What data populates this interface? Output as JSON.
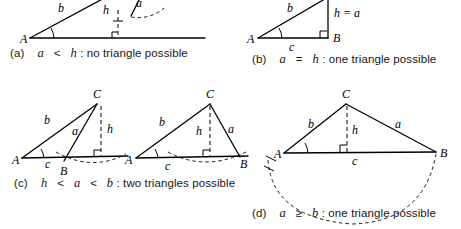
{
  "figure": {
    "panels": [
      {
        "id": "a",
        "tag": "(a)",
        "condition": "a < h",
        "result": "no triangle possible",
        "caption": "(a)  a < h: no triangle possible",
        "labels": [
          "A",
          "b",
          "h",
          "a"
        ],
        "vertices": [
          "A"
        ],
        "has_arc": true,
        "has_right_angle": true,
        "triangle_count": 0
      },
      {
        "id": "b",
        "tag": "(b)",
        "condition": "a = h",
        "result": "one triangle possible",
        "caption": "(b)  a = h: one triangle possible",
        "labels": [
          "A",
          "B",
          "b",
          "c",
          "h = a"
        ],
        "vertices": [
          "A",
          "B"
        ],
        "has_arc": false,
        "has_right_angle": true,
        "triangle_count": 1
      },
      {
        "id": "c",
        "tag": "(c)",
        "condition": "h < a < b",
        "result": "two triangles possible",
        "caption": "(c)  h < a < b: two triangles possible",
        "labels": [
          "A",
          "B",
          "C",
          "a",
          "b",
          "c",
          "h"
        ],
        "vertices": [
          "A",
          "B",
          "C"
        ],
        "has_arc": true,
        "has_right_angle": true,
        "triangle_count": 2
      },
      {
        "id": "d",
        "tag": "(d)",
        "condition": "a ≥ b",
        "result": "one triangle possible",
        "caption": "(d)  a ≥ b: one triangle possible",
        "labels": [
          "A",
          "B",
          "C",
          "a",
          "b",
          "c",
          "h"
        ],
        "vertices": [
          "A",
          "B",
          "C"
        ],
        "has_arc": true,
        "has_right_angle": true,
        "triangle_count": 1
      }
    ],
    "captions": {
      "a": {
        "tag": "(a)",
        "cond_left": "a",
        "op": "<",
        "cond_right": "h",
        "text": ": no triangle possible"
      },
      "b": {
        "tag": "(b)",
        "cond_left": "a",
        "op": "=",
        "cond_right": "h",
        "text": ": one triangle possible"
      },
      "c": {
        "tag": "(c)",
        "cond_left": "h",
        "op": "<",
        "cond_mid": "a",
        "op2": "<",
        "cond_right": "b",
        "text": ": two triangles possible"
      },
      "d": {
        "tag": "(d)",
        "cond_left": "a",
        "op": "≥",
        "cond_right": "b",
        "text": ": one triangle possible"
      }
    },
    "panel_a": {
      "vertex_A": "A",
      "side_b": "b",
      "height_h": "h",
      "side_a": "a"
    },
    "panel_b": {
      "vertex_A": "A",
      "vertex_B": "B",
      "side_b": "b",
      "side_c": "c",
      "height_eq": "h = a"
    },
    "panel_c1": {
      "vertex_A": "A",
      "vertex_B": "B",
      "vertex_C": "C",
      "side_a": "a",
      "side_b": "b",
      "side_c": "c",
      "height_h": "h"
    },
    "panel_c2": {
      "vertex_A": "A",
      "vertex_B": "B",
      "vertex_C": "C",
      "side_a": "a",
      "side_b": "b",
      "side_c": "c",
      "height_h": "h"
    },
    "panel_d": {
      "vertex_A": "A",
      "vertex_B": "B",
      "vertex_C": "C",
      "side_a": "a",
      "side_b": "b",
      "side_c": "c",
      "height_h": "h"
    },
    "colors": {
      "background": "#ffffff",
      "ink": "#000000",
      "caption_text": "#161616"
    }
  }
}
